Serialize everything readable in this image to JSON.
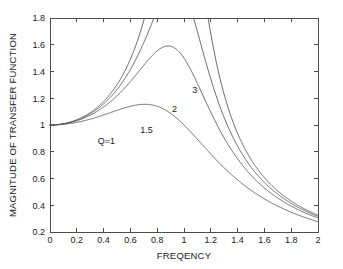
{
  "chart_data": {
    "type": "line",
    "title": "",
    "xlabel": "FREQENCY",
    "ylabel": "MAGNITUDE OF TRANSFER FUNCTION",
    "xlim": [
      0,
      2
    ],
    "ylim": [
      0.2,
      1.8
    ],
    "xticks": [
      "0",
      "0.2",
      "0.4",
      "0.6",
      "0.8",
      "1",
      "1.2",
      "1.4",
      "1.6",
      "1.8",
      "2"
    ],
    "xtick_values": [
      0,
      0.2,
      0.4,
      0.6,
      0.8,
      1,
      1.2,
      1.4,
      1.6,
      1.8,
      2
    ],
    "yticks": [
      "0.2",
      "0.4",
      "0.6",
      "0.8",
      "1",
      "1.2",
      "1.4",
      "1.6",
      "1.8"
    ],
    "ytick_values": [
      0.2,
      0.4,
      0.6,
      0.8,
      1,
      1.2,
      1.4,
      1.6,
      1.8
    ],
    "grid": false,
    "legend": "inline-annotations",
    "formula": "1/sqrt((1-f^2)^2 + (f/Q)^2)",
    "line_color": "#555555",
    "axis_color": "#4d4d4d",
    "background": "#ffffff",
    "series": [
      {
        "name": "Q=1",
        "q": 1,
        "label": "Q=1",
        "label_x": 0.42,
        "label_y": 0.885,
        "peak_x": 0.707,
        "peak_y": 1.155,
        "value_at_0": 1.0,
        "value_at_2": 0.248
      },
      {
        "name": "1.5",
        "q": 1.5,
        "label": "1.5",
        "label_x": 0.72,
        "label_y": 0.965,
        "peak_x": 0.8,
        "peak_y": 1.29,
        "value_at_0": 1.0,
        "value_at_2": 0.26
      },
      {
        "name": "2",
        "q": 2,
        "label": "2",
        "label_x": 0.93,
        "label_y": 1.125,
        "peak_x": 0.87,
        "peak_y": 1.35,
        "value_at_0": 1.0,
        "value_at_2": 0.277
      },
      {
        "name": "3",
        "q": 3,
        "label": "3",
        "label_x": 1.08,
        "label_y": 1.265,
        "peak_x": 0.93,
        "peak_y": 1.66,
        "value_at_0": 1.0,
        "value_at_2": 0.292
      }
    ]
  }
}
